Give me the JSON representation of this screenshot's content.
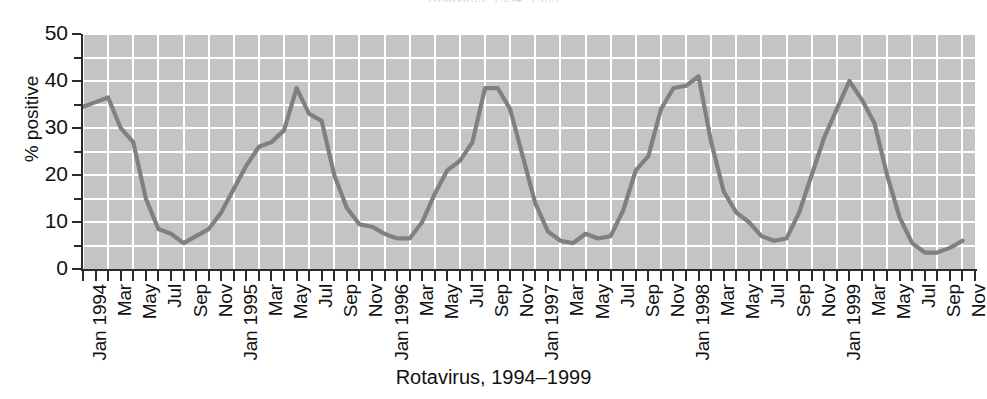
{
  "figure": {
    "clipped_title": "Rotavirus, 1994–1999",
    "caption": "Rotavirus, 1994–1999",
    "colors": {
      "plot_background": "#c4c4c4",
      "gridline": "#ffffff",
      "series_line": "#808080",
      "axis": "#2a2a2a",
      "text": "#111111"
    }
  },
  "axes": {
    "y_label": "% positive",
    "y_ticks_major": [
      "0",
      "10",
      "20",
      "30",
      "40",
      "50"
    ],
    "y_minor_ticks": [
      5,
      15,
      25,
      35,
      45
    ],
    "x_tick_labels": [
      "Jan 1994",
      "Mar",
      "May",
      "Jul",
      "Sep",
      "Nov",
      "Jan 1995",
      "Mar",
      "May",
      "Jul",
      "Sep",
      "Nov",
      "Jan 1996",
      "Mar",
      "May",
      "Jul",
      "Sep",
      "Nov",
      "Jan 1997",
      "Mar",
      "May",
      "Jul",
      "Sep",
      "Nov",
      "Jan 1998",
      "Mar",
      "May",
      "Jul",
      "Sep",
      "Nov",
      "Jan 1999",
      "Mar",
      "May",
      "Jul",
      "Sep",
      "Nov"
    ]
  },
  "chart_data": {
    "type": "line",
    "title": "Rotavirus, 1994–1999",
    "xlabel": "Rotavirus, 1994–1999",
    "ylabel": "% positive",
    "ylim": [
      0,
      50
    ],
    "y_ticks": [
      0,
      10,
      20,
      30,
      40,
      50
    ],
    "y_minor_ticks": [
      5,
      15,
      25,
      35,
      45
    ],
    "grid": true,
    "legend": "none",
    "x_tick_step_months": 2,
    "x": [
      "Jan 1994",
      "Feb 1994",
      "Mar 1994",
      "Apr 1994",
      "May 1994",
      "Jun 1994",
      "Jul 1994",
      "Aug 1994",
      "Sep 1994",
      "Oct 1994",
      "Nov 1994",
      "Dec 1994",
      "Jan 1995",
      "Feb 1995",
      "Mar 1995",
      "Apr 1995",
      "May 1995",
      "Jun 1995",
      "Jul 1995",
      "Aug 1995",
      "Sep 1995",
      "Oct 1995",
      "Nov 1995",
      "Dec 1995",
      "Jan 1996",
      "Feb 1996",
      "Mar 1996",
      "Apr 1996",
      "May 1996",
      "Jun 1996",
      "Jul 1996",
      "Aug 1996",
      "Sep 1996",
      "Oct 1996",
      "Nov 1996",
      "Dec 1996",
      "Jan 1997",
      "Feb 1997",
      "Mar 1997",
      "Apr 1997",
      "May 1997",
      "Jun 1997",
      "Jul 1997",
      "Aug 1997",
      "Sep 1997",
      "Oct 1997",
      "Nov 1997",
      "Dec 1997",
      "Jan 1998",
      "Feb 1998",
      "Mar 1998",
      "Apr 1998",
      "May 1998",
      "Jun 1998",
      "Jul 1998",
      "Aug 1998",
      "Sep 1998",
      "Oct 1998",
      "Nov 1998",
      "Dec 1998",
      "Jan 1999",
      "Feb 1999",
      "Mar 1999",
      "Apr 1999",
      "May 1999",
      "Jun 1999",
      "Jul 1999",
      "Aug 1999",
      "Sep 1999",
      "Oct 1999",
      "Nov 1999"
    ],
    "series": [
      {
        "name": "% positive",
        "color": "#808080",
        "values": [
          34.5,
          35.5,
          36.5,
          30.0,
          27.0,
          15.0,
          8.5,
          7.5,
          5.5,
          7.0,
          8.5,
          12.0,
          17.0,
          22.0,
          26.0,
          27.0,
          29.5,
          38.5,
          33.0,
          31.5,
          20.0,
          13.0,
          9.5,
          9.0,
          7.5,
          6.5,
          6.5,
          10.0,
          16.0,
          21.0,
          23.0,
          27.0,
          38.5,
          38.5,
          34.0,
          24.0,
          14.0,
          8.0,
          6.0,
          5.5,
          7.5,
          6.5,
          7.0,
          12.5,
          21.0,
          24.0,
          34.0,
          38.5,
          39.0,
          41.0,
          27.0,
          16.5,
          12.0,
          10.0,
          7.0,
          6.0,
          6.5,
          12.0,
          20.0,
          28.0,
          34.0,
          40.0,
          36.0,
          31.0,
          20.0,
          11.0,
          5.5,
          3.5,
          3.5,
          4.5,
          6.0
        ]
      }
    ],
    "series_full": {
      "name": "% positive",
      "note": "71 monthly points, Jan 1994 through Nov 1999",
      "values": [
        34.5,
        35.5,
        36.5,
        30.0,
        27.0,
        15.0,
        8.5,
        7.5,
        5.5,
        7.0,
        8.5,
        12.0,
        17.0,
        22.0,
        26.0,
        27.0,
        29.5,
        38.5,
        33.0,
        31.5,
        20.0,
        13.0,
        9.5,
        9.0,
        7.5,
        6.5,
        6.5,
        10.0,
        16.0,
        21.0,
        23.0,
        27.0,
        38.5,
        38.5,
        34.0,
        24.0,
        14.0,
        8.0,
        6.0,
        5.5,
        7.5,
        6.5,
        7.0,
        12.5,
        21.0,
        24.0,
        34.0,
        38.5,
        39.0,
        41.0,
        27.0,
        16.5,
        12.0,
        10.0,
        7.0,
        6.0,
        6.5,
        12.0,
        20.0,
        28.0,
        34.0,
        40.0,
        36.0,
        31.0,
        20.0,
        11.0,
        5.5,
        3.5,
        3.5,
        4.5,
        6.0
      ]
    },
    "annual_peaks": [
      {
        "year": "1994",
        "peak_month": "Mar",
        "peak_value": 36.5,
        "trough_month": "Sep",
        "trough_value": 5.5
      },
      {
        "year": "1995",
        "peak_month": "Mar",
        "peak_value": 38.5,
        "trough_month": "Sep",
        "trough_value": 6.5
      },
      {
        "year": "1996",
        "peak_month": "Mar",
        "peak_value": 38.5,
        "trough_month": "Sep",
        "trough_value": 5.5
      },
      {
        "year": "1997",
        "peak_month": "May",
        "peak_value": 41.0,
        "trough_month": "Sep",
        "trough_value": 6.0
      },
      {
        "year": "1998",
        "peak_month": "Mar",
        "peak_value": 40.0,
        "trough_month": "Sep",
        "trough_value": 3.5
      },
      {
        "year": "1999",
        "peak_month": "Mar",
        "peak_value": 44.0,
        "trough_month": "Sep",
        "trough_value": 4.0
      }
    ]
  }
}
